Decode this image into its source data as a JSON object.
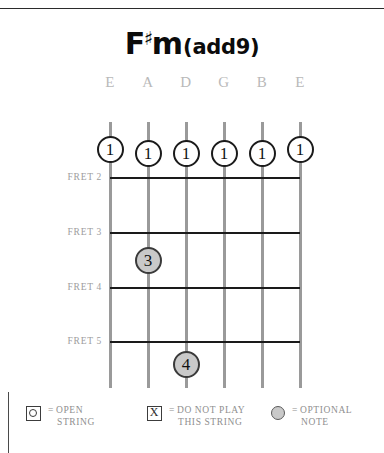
{
  "chord": {
    "root": "F",
    "accidental": "♯",
    "quality": "m",
    "extension": "(add9)",
    "full_name": "F#m(add9)"
  },
  "strings": {
    "labels": [
      "E",
      "A",
      "D",
      "G",
      "B",
      "E"
    ]
  },
  "frets": {
    "labels": [
      "FRET 2",
      "FRET 3",
      "FRET 4",
      "FRET 5"
    ]
  },
  "fingering": {
    "barre": [
      {
        "finger": "1",
        "string": "E",
        "type": "barre"
      },
      {
        "finger": "1",
        "string": "A",
        "type": "barre"
      },
      {
        "finger": "1",
        "string": "D",
        "type": "barre"
      },
      {
        "finger": "1",
        "string": "G",
        "type": "barre"
      },
      {
        "finger": "1",
        "string": "B",
        "type": "barre"
      },
      {
        "finger": "1",
        "string": "E",
        "type": "barre"
      }
    ],
    "dots": [
      {
        "finger": "3",
        "string": "A",
        "fret": "3",
        "type": "optional"
      },
      {
        "finger": "4",
        "string": "D",
        "fret": "5",
        "type": "optional"
      }
    ]
  },
  "legend": {
    "items": [
      {
        "icon": "open-string-icon",
        "equals": "=",
        "line1": "OPEN",
        "line2": "STRING"
      },
      {
        "icon": "muted-string-icon",
        "equals": "=",
        "line1": "DO NOT PLAY",
        "line2": "THIS STRING"
      },
      {
        "icon": "optional-note-icon",
        "equals": "=",
        "line1": "OPTIONAL",
        "line2": "NOTE"
      }
    ],
    "x_glyph": "X"
  },
  "colors": {
    "string": "#9a9a9a",
    "fret": "#1a1a1a",
    "optional_fill": "#c9c9c9",
    "label_gray": "#9d9d9d"
  }
}
